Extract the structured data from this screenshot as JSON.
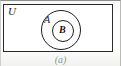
{
  "figure": {
    "caption": "(a)",
    "universe": {
      "label": "U",
      "shape": "rectangle"
    },
    "sets": [
      {
        "label": "A",
        "shape": "circle",
        "relation": "subset-of-universe"
      },
      {
        "label": "B",
        "shape": "circle",
        "relation": "subset-of-A"
      }
    ],
    "colors": {
      "stroke": "#1f1f1f",
      "background": "#ffffff",
      "caption": "#585856"
    }
  }
}
